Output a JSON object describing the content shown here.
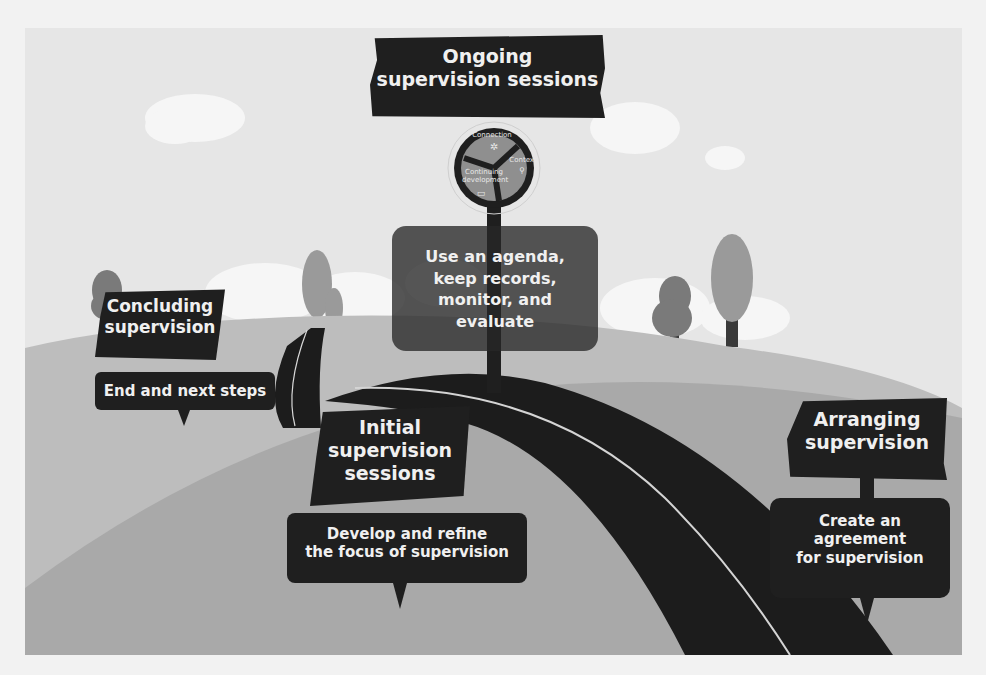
{
  "diagram": {
    "top_sign": {
      "title_line1": "Ongoing",
      "title_line2": "supervision sessions"
    },
    "cycle_wheel": {
      "segments": [
        {
          "label": "Connection",
          "icon": "star-people-icon"
        },
        {
          "label": "Context",
          "icon": "map-pin-icon"
        },
        {
          "label_line1": "Continuing",
          "label_line2": "development",
          "icon": "monitor-icon"
        }
      ]
    },
    "ongoing_box": {
      "line1": "Use an agenda,",
      "line2": "keep records,",
      "line3": "monitor, and",
      "line4": "evaluate"
    },
    "stages": [
      {
        "id": "concluding",
        "title_line1": "Concluding",
        "title_line2": "supervision",
        "sub_line1": "End and next steps"
      },
      {
        "id": "initial",
        "title_line1": "Initial",
        "title_line2": "supervision",
        "title_line3": "sessions",
        "sub_line1": "Develop and refine",
        "sub_line2": "the focus of supervision"
      },
      {
        "id": "arranging",
        "title_line1": "Arranging",
        "title_line2": "supervision",
        "sub_line1": "Create an",
        "sub_line2": "agreement",
        "sub_line3": "for supervision"
      }
    ],
    "colors": {
      "sky": "#e6e6e6",
      "back_hill": "#bdbdbd",
      "front_hill": "#a9a9a9",
      "road": "#1c1c1c",
      "sign": "#1f1f1f",
      "tree_dark": "#7a7a7a",
      "tree_light": "#9a9a9a"
    }
  }
}
